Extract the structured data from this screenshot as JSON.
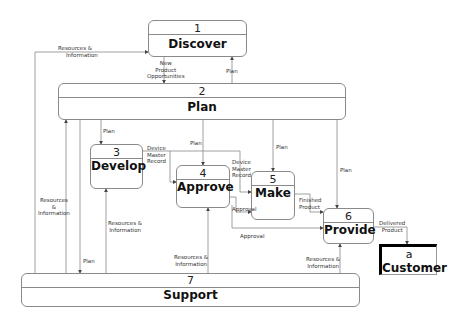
{
  "diagram": {
    "type": "data-flow",
    "processes": [
      {
        "id": "1",
        "name": "Discover"
      },
      {
        "id": "2",
        "name": "Plan"
      },
      {
        "id": "3",
        "name": "Develop"
      },
      {
        "id": "4",
        "name": "Approve"
      },
      {
        "id": "5",
        "name": "Make"
      },
      {
        "id": "6",
        "name": "Provide"
      },
      {
        "id": "7",
        "name": "Support"
      }
    ],
    "external_entities": [
      {
        "id": "a",
        "name": "Customer"
      }
    ],
    "flows": {
      "res_info_to_discover": [
        "Resources &",
        "Information"
      ],
      "new_product_opps": [
        "New",
        "Product",
        "Opportunities"
      ],
      "plan_to_discover": "Plan",
      "plan_to_develop": "Plan",
      "plan_to_approve": "Plan",
      "plan_to_make": "Plan",
      "plan_to_provide": "Plan",
      "dmr_develop": [
        "Device",
        "Master",
        "Record"
      ],
      "dmr_make": [
        "Device",
        "Master",
        "Record"
      ],
      "approval_make": "Approval",
      "approval_provide": "Approval",
      "finished_product": [
        "Finished",
        "Product"
      ],
      "delivered_product": [
        "Delivered",
        "Product"
      ],
      "res_info_left": [
        "Resources",
        "&",
        "Information"
      ],
      "plan_support": "Plan",
      "res_info_develop": [
        "Resources &",
        "Information"
      ],
      "res_info_approve": [
        "Resources &",
        "Information"
      ],
      "res_info_provide": [
        "Resources &",
        "Information"
      ]
    }
  }
}
